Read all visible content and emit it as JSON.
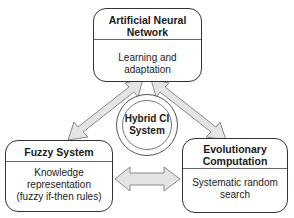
{
  "diagram": {
    "hub": {
      "label_line1": "Hybrid CI",
      "label_line2": "System"
    },
    "nodes": [
      {
        "id": "ann",
        "title_line1": "Artificial Neural",
        "title_line2": "Network",
        "desc_line1": "Learning and adaptation"
      },
      {
        "id": "fuzzy",
        "title_line1": "Fuzzy System",
        "desc_line1": "Knowledge",
        "desc_line2": "representation",
        "desc_line3": "(fuzzy if-then rules)"
      },
      {
        "id": "ec",
        "title_line1": "Evolutionary",
        "title_line2": "Computation",
        "desc_line1": "Systematic random",
        "desc_line2": "search"
      }
    ],
    "edges": [
      {
        "from": "ann",
        "to": "fuzzy",
        "type": "bidirectional"
      },
      {
        "from": "ann",
        "to": "ec",
        "type": "bidirectional"
      },
      {
        "from": "fuzzy",
        "to": "ec",
        "type": "bidirectional"
      }
    ],
    "colors": {
      "arrow_fill": "#e4e4e4",
      "arrow_stroke": "#8a8a8a",
      "box_border": "#333333"
    }
  }
}
